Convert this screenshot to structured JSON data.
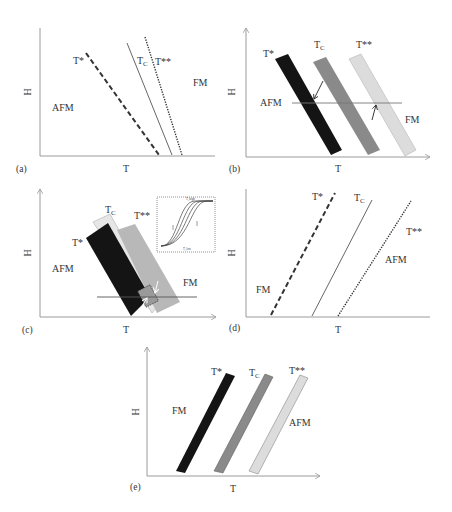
{
  "figure": {
    "colors": {
      "axis": "#9a9a9a",
      "line": "#444444",
      "band_black": "#141414",
      "band_gray": "#8a8a8a",
      "band_light": "#dcdcdc",
      "band_light_stroke": "#aaaaaa"
    },
    "axis_labels": {
      "x": "T",
      "y": "H"
    },
    "panels": [
      {
        "id": "a",
        "tag": "(a)",
        "regions": {
          "left": "AFM",
          "right": "FM"
        },
        "lines": [
          {
            "label": "T*",
            "style": "dashed"
          },
          {
            "label": "T",
            "sub": "C",
            "style": "solid"
          },
          {
            "label": "T**",
            "style": "dotted"
          }
        ]
      },
      {
        "id": "b",
        "tag": "(b)",
        "regions": {
          "left": "AFM",
          "right": "FM"
        },
        "bands": [
          {
            "label": "T*",
            "shade": "black"
          },
          {
            "label": "T",
            "sub": "C",
            "shade": "gray"
          },
          {
            "label": "T**",
            "shade": "light"
          }
        ]
      },
      {
        "id": "c",
        "tag": "(c)",
        "regions": {
          "left": "AFM",
          "right": "FM"
        },
        "bands": [
          {
            "label": "T*",
            "shade": "black"
          },
          {
            "label": "T",
            "sub": "C",
            "shade": "light"
          },
          {
            "label": "T**",
            "shade": "gray"
          }
        ],
        "inset": {
          "description": "hysteresis loops (sigmoidal M vs T curves)",
          "top_label": "T_high",
          "bottom_label": "T_low"
        }
      },
      {
        "id": "d",
        "tag": "(d)",
        "regions": {
          "left": "FM",
          "right": "AFM"
        },
        "lines": [
          {
            "label": "T*",
            "style": "dashed"
          },
          {
            "label": "T",
            "sub": "C",
            "style": "solid"
          },
          {
            "label": "T**",
            "style": "dotted"
          }
        ]
      },
      {
        "id": "e",
        "tag": "(e)",
        "regions": {
          "left": "FM",
          "right": "AFM"
        },
        "bands": [
          {
            "label": "T*",
            "shade": "black"
          },
          {
            "label": "T",
            "sub": "C",
            "shade": "gray"
          },
          {
            "label": "T**",
            "shade": "light"
          }
        ]
      }
    ]
  }
}
